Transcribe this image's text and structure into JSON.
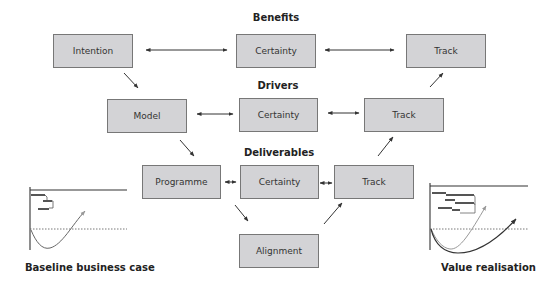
{
  "headings": {
    "benefits": "Benefits",
    "drivers": "Drivers",
    "deliverables": "Deliverables"
  },
  "boxes": {
    "intention": "Intention",
    "benefits_certainty": "Certainty",
    "benefits_track": "Track",
    "model": "Model",
    "drivers_certainty": "Certainty",
    "drivers_track": "Track",
    "programme": "Programme",
    "deliverables_certainty": "Certainty",
    "deliverables_track": "Track",
    "alignment": "Alignment"
  },
  "captions": {
    "left": "Baseline business case",
    "right": "Value realisation"
  },
  "colors": {
    "box_fill": "#d3d3d6",
    "box_border": "#777777",
    "arrow": "#333333"
  }
}
